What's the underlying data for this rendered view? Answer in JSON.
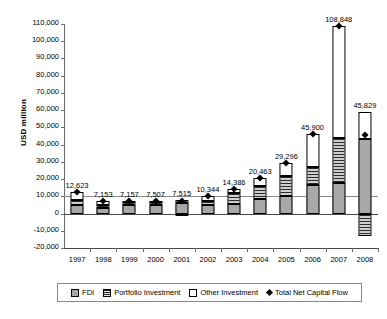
{
  "chart_data": {
    "type": "bar",
    "title": "",
    "xlabel": "",
    "ylabel": "USD million",
    "ylim": [
      -20000,
      110000
    ],
    "ytick_step": 10000,
    "grid": true,
    "stacked": true,
    "legend_position": "bottom",
    "categories": [
      "1997",
      "1998",
      "1999",
      "2000",
      "2001",
      "2002",
      "2003",
      "2004",
      "2005",
      "2006",
      "2007",
      "2008"
    ],
    "ytick_labels": [
      "110,000",
      "100,000",
      "90,000",
      "80,000",
      "70,000",
      "60,000",
      "50,000",
      "40,000",
      "30,000",
      "20,000",
      "10,000",
      "0",
      "-10,000",
      "-20,000"
    ],
    "series": [
      {
        "name": "FDI",
        "values": [
          5100,
          3300,
          4700,
          4800,
          6200,
          5200,
          5300,
          8400,
          10200,
          16300,
          17900,
          43200
        ]
      },
      {
        "name": "Portfolio Investment",
        "values": [
          2600,
          1500,
          2100,
          1700,
          1800,
          2100,
          6600,
          7300,
          11700,
          10500,
          26000,
          -13000
        ]
      },
      {
        "name": "Other Investment",
        "values": [
          4923,
          2353,
          357,
          1007,
          -485,
          3044,
          2486,
          4763,
          7396,
          19100,
          64948,
          15629
        ]
      }
    ],
    "markers": {
      "name": "Total Net Capital Flow",
      "values": [
        12623,
        7153,
        7157,
        7507,
        7515,
        10344,
        14386,
        20463,
        29296,
        45900,
        108848,
        45829
      ]
    },
    "value_labels": [
      "12,623",
      "7,153",
      "7,157",
      "7,507",
      "7,515",
      "10,344",
      "14,386",
      "20,463",
      "29,296",
      "45,900",
      "108,848",
      "45,829"
    ]
  },
  "legend": {
    "items": [
      {
        "label": "FDI",
        "icon": "fdi-swatch"
      },
      {
        "label": "Portfolio Investment",
        "icon": "portfolio-swatch"
      },
      {
        "label": "Other Investment",
        "icon": "other-swatch"
      },
      {
        "label": "Total Net Capital Flow",
        "icon": "diamond-marker"
      }
    ]
  }
}
